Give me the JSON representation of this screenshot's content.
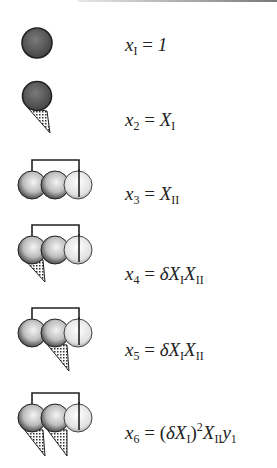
{
  "diagram": {
    "rows": [
      {
        "icon": "single-dark-sphere",
        "lhs": "x",
        "lhs_sub": "I",
        "eq": "=",
        "rhs_html": "1"
      },
      {
        "icon": "dark-sphere-with-cone",
        "lhs": "x",
        "lhs_sub": "2",
        "eq": "=",
        "rhs_html": "X_I"
      },
      {
        "icon": "three-sphere-chain",
        "lhs": "x",
        "lhs_sub": "3",
        "eq": "=",
        "rhs_html": "X_II"
      },
      {
        "icon": "three-sphere-chain-cone-first",
        "lhs": "x",
        "lhs_sub": "4",
        "eq": "=",
        "rhs_html": "δX_I X_II"
      },
      {
        "icon": "three-sphere-chain-cone-second",
        "lhs": "x",
        "lhs_sub": "5",
        "eq": "=",
        "rhs_html": "δX_I X_II"
      },
      {
        "icon": "three-sphere-chain-two-cones",
        "lhs": "x",
        "lhs_sub": "6",
        "eq": "=",
        "rhs_html": "(δX_I)^2 X_II y_1"
      }
    ],
    "text": {
      "r1_lhs": "x",
      "r1_sub": "I",
      "r1_eq": "=",
      "r1_rhs": "1",
      "r2_lhs": "x",
      "r2_sub": "2",
      "r2_eq": "=",
      "r2_rhs": "X",
      "r2_rhs_sub": "I",
      "r3_lhs": "x",
      "r3_sub": "3",
      "r3_eq": "=",
      "r3_rhs": "X",
      "r3_rhs_sub": "II",
      "r4_lhs": "x",
      "r4_sub": "4",
      "r4_eq": "=",
      "r4_delta": "δ",
      "r4_a": "X",
      "r4_a_sub": "I",
      "r4_b": "X",
      "r4_b_sub": "II",
      "r5_lhs": "x",
      "r5_sub": "5",
      "r5_eq": "=",
      "r5_delta": "δ",
      "r5_a": "X",
      "r5_a_sub": "I",
      "r5_b": "X",
      "r5_b_sub": "II",
      "r6_lhs": "x",
      "r6_sub": "6",
      "r6_eq": "=",
      "r6_open": "(",
      "r6_delta": "δ",
      "r6_a": "X",
      "r6_a_sub": "I",
      "r6_close": ")",
      "r6_pow": "2",
      "r6_b": "X",
      "r6_b_sub": "II",
      "r6_c": "y",
      "r6_c_sub": "1"
    },
    "colors": {
      "dark_sphere": "#555555",
      "light_sphere": "#e6e6e6",
      "outline": "#222222",
      "cone_fill": "#cfcfcf"
    }
  }
}
